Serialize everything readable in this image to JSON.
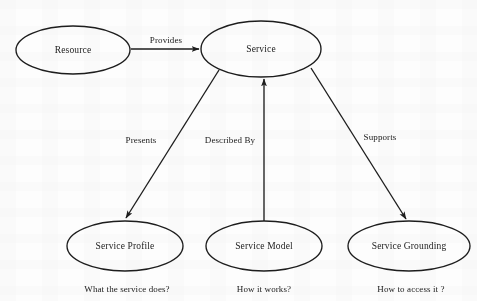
{
  "diagram": {
    "stroke_color": "#1d1d1d",
    "text_color": "#1b1b1b",
    "background_color": "#fdfdfd",
    "nodes": [
      {
        "id": "resource",
        "label": "Resource",
        "cx": 73,
        "cy": 50,
        "rx": 57,
        "ry": 24
      },
      {
        "id": "service",
        "label": "Service",
        "cx": 261,
        "cy": 49,
        "rx": 60,
        "ry": 28
      },
      {
        "id": "service-profile",
        "label": "Service Profile",
        "cx": 125,
        "cy": 246,
        "rx": 58,
        "ry": 25
      },
      {
        "id": "service-model",
        "label": "Service Model",
        "cx": 264,
        "cy": 246,
        "rx": 58,
        "ry": 25
      },
      {
        "id": "service-grounding",
        "label": "Service Grounding",
        "cx": 409,
        "cy": 246,
        "rx": 61,
        "ry": 25
      }
    ],
    "edges": [
      {
        "id": "provides",
        "label": "Provides",
        "from": "resource",
        "to": "service",
        "label_x": 166,
        "label_y": 40
      },
      {
        "id": "presents",
        "label": "Presents",
        "from": "service",
        "to": "service-profile",
        "label_x": 141,
        "label_y": 140
      },
      {
        "id": "described-by",
        "label": "Described By",
        "from": "service-model",
        "to": "service",
        "label_x": 230,
        "label_y": 140
      },
      {
        "id": "supports",
        "label": "Supports",
        "from": "service",
        "to": "service-grounding",
        "label_x": 380,
        "label_y": 137
      }
    ],
    "captions": [
      {
        "id": "caption-service-profile",
        "text": "What the service does?",
        "x": 127,
        "y": 289
      },
      {
        "id": "caption-service-model",
        "text": "How it works?",
        "x": 264,
        "y": 289
      },
      {
        "id": "caption-service-grounding",
        "text": "How to access it ?",
        "x": 411,
        "y": 289
      }
    ]
  }
}
